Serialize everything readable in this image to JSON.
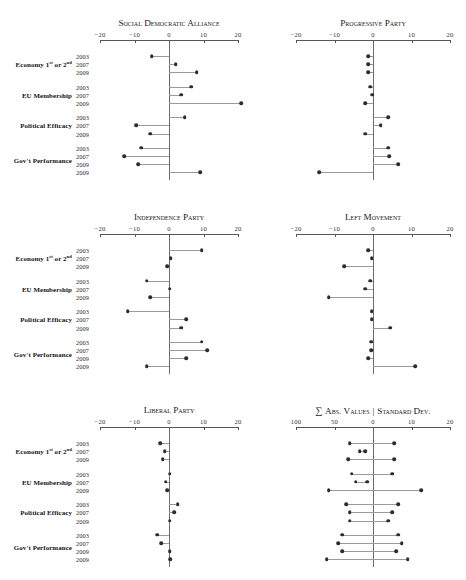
{
  "figure": {
    "width": 466,
    "height": 580,
    "dot_color": "#2b2b33",
    "stem_color": "#9a9a9f",
    "axis_color": "#55555a"
  },
  "row_labels": [
    "Economy 1st or 2nd",
    "EU Membership",
    "Political Efficacy",
    "Gov't Performance"
  ],
  "row_label_html": [
    "Economy 1<sup>st</sup> or 2<sup>nd</sup>",
    "EU Membership",
    "Political Efficacy",
    "Gov't Performance"
  ],
  "year_labels": [
    [
      "2003",
      "2007",
      "2009"
    ],
    [
      "2003",
      "2007",
      "2009"
    ],
    [
      "2003",
      "2007",
      "2009"
    ],
    [
      "2003",
      "2007",
      "2009",
      "2009"
    ]
  ],
  "axis": {
    "ticks": [
      -20,
      -10,
      0,
      10,
      20
    ],
    "tick_labels": [
      "−20",
      "−10",
      "0",
      "10",
      "20"
    ],
    "min": -20,
    "max": 20
  },
  "summary_axis": {
    "ticks": [
      -20,
      -10,
      0,
      10,
      20
    ],
    "tick_labels": [
      "100",
      "50",
      "0",
      "10",
      "20"
    ],
    "min": -20,
    "max": 20
  },
  "chart_data": {
    "type": "scatter",
    "xlabel": "",
    "ylabel": "",
    "xlim": [
      -20,
      20
    ],
    "grid": false,
    "legend": "none",
    "panel_layout": "3 rows x 2 columns",
    "categories": [
      "Economy 1st or 2nd — 2003",
      "Economy 1st or 2nd — 2007",
      "Economy 1st or 2nd — 2009",
      "EU Membership — 2003",
      "EU Membership — 2007",
      "EU Membership — 2009",
      "Political Efficacy — 2003",
      "Political Efficacy — 2007",
      "Political Efficacy — 2009",
      "Gov't Performance — 2003",
      "Gov't Performance — 2007",
      "Gov't Performance — 2009",
      "Gov't Performance — 2009b"
    ],
    "panels": [
      {
        "name": "social-democratic-alliance",
        "title": "Social Democratic Alliance",
        "row": 0,
        "col": 0,
        "values": [
          -5.0,
          2.0,
          8.0,
          6.5,
          3.5,
          21.0,
          4.5,
          -9.5,
          -5.5,
          -8.0,
          -13.0,
          -9.0,
          9.0
        ]
      },
      {
        "name": "progressive-party",
        "title": "Progressive Party",
        "row": 0,
        "col": 1,
        "values": [
          -1.2,
          -1.2,
          -1.2,
          -0.8,
          -0.2,
          -2.0,
          4.0,
          2.0,
          -2.0,
          4.0,
          4.2,
          6.5,
          -14.0
        ]
      },
      {
        "name": "independence-party",
        "title": "Independence Party",
        "row": 1,
        "col": 0,
        "values": [
          9.5,
          0.5,
          -0.5,
          -6.5,
          0.2,
          -5.5,
          -12.0,
          5.0,
          3.5,
          9.5,
          11.0,
          5.0,
          -6.5
        ]
      },
      {
        "name": "left-movement",
        "title": "Left Movement",
        "row": 1,
        "col": 1,
        "values": [
          -1.2,
          -0.3,
          -7.5,
          -0.8,
          -2.0,
          -11.5,
          -0.3,
          -0.3,
          4.5,
          -0.5,
          -0.5,
          -1.2,
          11.0
        ]
      },
      {
        "name": "liberal-party",
        "title": "Liberal Party",
        "row": 2,
        "col": 0,
        "values": [
          -2.5,
          -1.2,
          -1.8,
          0.2,
          -1.0,
          -0.6,
          2.5,
          1.5,
          0.2,
          -3.5,
          -2.2,
          0.2,
          0.4
        ]
      }
    ],
    "summary_panel": {
      "name": "abs-values-standard-dev",
      "title_sigma": "∑",
      "title_left": "Abs. Values",
      "title_separator": "|",
      "title_right": "Standard Dev.",
      "row": 2,
      "col": 1,
      "left_scale_note": "left half axis labelled 100 and 50 (sum of absolute values); right half labelled 10 and 20 (standard deviation)",
      "series": [
        {
          "name": "Sum of absolute values",
          "values": [
            -6.0,
            -3.5,
            -6.5,
            -5.5,
            -4.5,
            -11.5,
            -7.0,
            -6.0,
            -6.0,
            -8.0,
            -9.0,
            -8.0,
            -12.0
          ]
        },
        {
          "name": "Standard deviation",
          "values": [
            5.5,
            -2.0,
            5.5,
            5.0,
            -1.5,
            12.5,
            6.5,
            5.0,
            4.0,
            6.5,
            7.5,
            6.0,
            9.0
          ]
        }
      ]
    }
  }
}
